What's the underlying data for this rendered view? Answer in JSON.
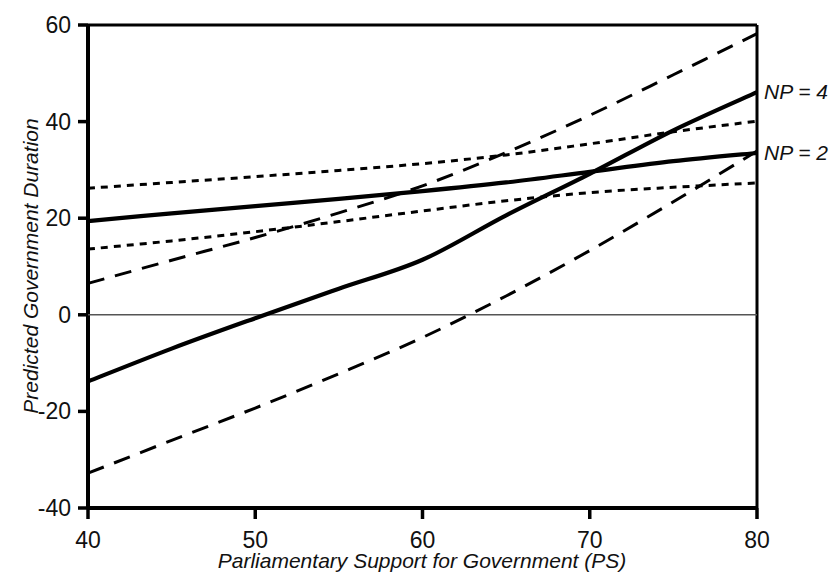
{
  "chart_data": {
    "type": "line",
    "title": "",
    "xlabel": "Parliamentary Support for Government (PS)",
    "ylabel": "Predicted Government Duration",
    "xlim": [
      40,
      80
    ],
    "ylim": [
      -40,
      60
    ],
    "xticks": [
      40,
      50,
      60,
      70,
      80
    ],
    "yticks": [
      -40,
      -20,
      0,
      20,
      40,
      60
    ],
    "grid": false,
    "legend_position": "right-inline",
    "zero_line": 0,
    "annotations": [
      {
        "text": "NP = 4",
        "x": 80,
        "y": 46.1
      },
      {
        "text": "NP = 2",
        "x": 80,
        "y": 33.5
      }
    ],
    "series": [
      {
        "name": "NP = 4",
        "style": "solid",
        "role": "point-estimate",
        "x": [
          40,
          45,
          50,
          55,
          60,
          65,
          70,
          75,
          80
        ],
        "values": [
          -13.8,
          -7.0,
          -0.7,
          5.4,
          11.4,
          20.6,
          29.2,
          38.2,
          46.1
        ]
      },
      {
        "name": "NP = 4 upper bound",
        "style": "dashed",
        "role": "confidence-upper",
        "x": [
          40,
          45,
          50,
          55,
          60,
          65,
          70,
          75,
          80
        ],
        "values": [
          6.5,
          11.3,
          16.0,
          21.1,
          26.7,
          33.6,
          41.3,
          49.7,
          58.2
        ]
      },
      {
        "name": "NP = 4 lower bound",
        "style": "dashed",
        "role": "confidence-lower",
        "x": [
          40,
          45,
          50,
          55,
          60,
          65,
          70,
          75,
          80
        ],
        "values": [
          -32.8,
          -26.0,
          -19.3,
          -12.2,
          -4.7,
          3.9,
          13.3,
          23.4,
          33.9
        ]
      },
      {
        "name": "NP = 2",
        "style": "solid",
        "role": "point-estimate",
        "x": [
          40,
          45,
          50,
          55,
          60,
          65,
          70,
          75,
          80
        ],
        "values": [
          19.4,
          21.0,
          22.5,
          24.0,
          25.6,
          27.4,
          29.6,
          31.8,
          33.5
        ]
      },
      {
        "name": "NP = 2 upper bound",
        "style": "dotted",
        "role": "confidence-upper",
        "x": [
          40,
          45,
          50,
          55,
          60,
          65,
          70,
          75,
          80
        ],
        "values": [
          26.2,
          27.4,
          28.6,
          29.9,
          31.3,
          33.1,
          35.4,
          37.9,
          40.1
        ]
      },
      {
        "name": "NP = 2 lower bound",
        "style": "dotted",
        "role": "confidence-lower",
        "x": [
          40,
          45,
          50,
          55,
          60,
          65,
          70,
          75,
          80
        ],
        "values": [
          13.6,
          15.3,
          17.2,
          19.3,
          21.5,
          23.6,
          25.3,
          26.4,
          27.3
        ]
      }
    ],
    "colors": {
      "line": "#000000",
      "axis": "#000000",
      "zero_line": "#555555",
      "background": "#ffffff"
    }
  },
  "axes": {
    "x_tick_labels": [
      "40",
      "50",
      "60",
      "70",
      "80"
    ],
    "y_tick_labels": [
      "60",
      "40",
      "20",
      "0",
      "-20",
      "-40"
    ],
    "x_title": "Parliamentary Support for Government (PS)",
    "y_title": "Predicted Government Duration"
  },
  "labels": {
    "np4": "NP = 4",
    "np2": "NP = 2"
  }
}
